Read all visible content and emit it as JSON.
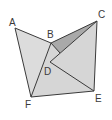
{
  "diagram": {
    "type": "geometry-figure",
    "background": "#ffffff",
    "stroke_color": "#3a3a3a",
    "fill_light": "#dcdcdc",
    "fill_dark": "#a9a9a9",
    "points": {
      "A": {
        "label": "A",
        "x": 15,
        "y": 28
      },
      "B": {
        "label": "B",
        "x": 51,
        "y": 43
      },
      "C": {
        "label": "C",
        "x": 97,
        "y": 21
      },
      "D": {
        "label": "D",
        "x": 50,
        "y": 62
      },
      "E": {
        "label": "E",
        "x": 94,
        "y": 91
      },
      "F": {
        "label": "F",
        "x": 31,
        "y": 97
      }
    },
    "labels": [
      {
        "id": "A",
        "text": "A",
        "x": 9,
        "y": 26
      },
      {
        "id": "B",
        "text": "B",
        "x": 47,
        "y": 38
      },
      {
        "id": "C",
        "text": "C",
        "x": 98,
        "y": 18
      },
      {
        "id": "D",
        "text": "D",
        "x": 44,
        "y": 75
      },
      {
        "id": "E",
        "text": "E",
        "x": 95,
        "y": 102
      },
      {
        "id": "F",
        "text": "F",
        "x": 25,
        "y": 108
      }
    ],
    "segments": [
      "AB",
      "AF",
      "BF",
      "BC",
      "CD",
      "CE",
      "DE",
      "EF",
      "BD"
    ]
  }
}
